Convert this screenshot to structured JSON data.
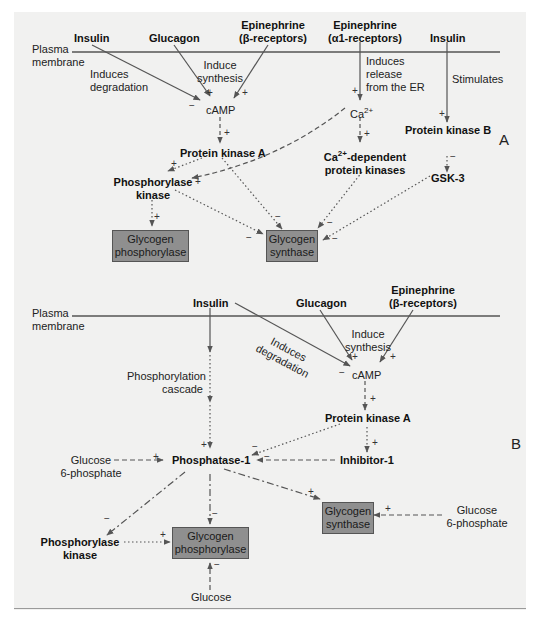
{
  "panelA": {
    "letter": "A",
    "membrane_label": [
      "Plasma",
      "membrane"
    ],
    "signals": {
      "insulin1": "Insulin",
      "glucagon": "Glucagon",
      "epi_beta": [
        "Epinephrine",
        "(β-receptors)"
      ],
      "epi_alpha": [
        "Epinephrine",
        "(α1-receptors)"
      ],
      "insulin2": "Insulin"
    },
    "annotations": {
      "induces_degradation": [
        "Induces",
        "degradation"
      ],
      "induce_synthesis": [
        "Induce",
        "synthesis"
      ],
      "induces_release": [
        "Induces",
        "release",
        "from the ER"
      ],
      "stimulates": "Stimulates"
    },
    "nodes": {
      "camp": "cAMP",
      "ca": "Ca2+",
      "pka": "Protein kinase A",
      "ca_kinases": [
        "Ca2+-dependent",
        "protein kinases"
      ],
      "pkb": "Protein kinase B",
      "phk": [
        "Phosphorylase",
        "kinase"
      ],
      "gsk3": "GSK-3",
      "gp_box": [
        "Glycogen",
        "phosphorylase"
      ],
      "gs_box": [
        "Glycogen",
        "synthase"
      ]
    }
  },
  "panelB": {
    "letter": "B",
    "membrane_label": [
      "Plasma",
      "membrane"
    ],
    "signals": {
      "insulin": "Insulin",
      "glucagon": "Glucagon",
      "epi_beta": [
        "Epinephrine",
        "(β-receptors)"
      ]
    },
    "annotations": {
      "induces_degradation": [
        "Induces",
        "degradation"
      ],
      "induce_synthesis": [
        "Induce",
        "synthesis"
      ],
      "phospho_cascade": [
        "Phosphorylation",
        "cascade"
      ]
    },
    "nodes": {
      "camp": "cAMP",
      "pka": "Protein kinase A",
      "pp1": "Phosphatase-1",
      "inhibitor1": "Inhibitor-1",
      "g6p_left": [
        "Glucose",
        "6-phosphate"
      ],
      "g6p_right": [
        "Glucose",
        "6-phosphate"
      ],
      "phk": [
        "Phosphorylase",
        "kinase"
      ],
      "gp_box": [
        "Glycogen",
        "phosphorylase"
      ],
      "gs_box": [
        "Glycogen",
        "synthase"
      ],
      "glucose": "Glucose"
    }
  },
  "signs": {
    "plus": "+",
    "minus": "−"
  },
  "colors": {
    "panel_bg": "#f1f1f0",
    "box_fill": "#8f8f8f",
    "line": "#555555"
  }
}
